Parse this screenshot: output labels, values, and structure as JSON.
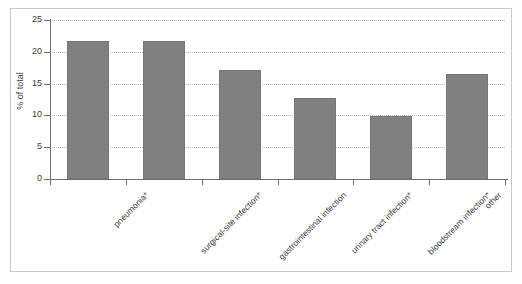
{
  "chart_data": {
    "type": "bar",
    "title": "",
    "xlabel": "",
    "ylabel": "% of total",
    "ylim": [
      0,
      25
    ],
    "yticks": [
      0,
      5,
      10,
      15,
      20,
      25
    ],
    "ytick_labels": [
      "0",
      "5",
      "10",
      "15",
      "20",
      "25"
    ],
    "grid": true,
    "grid_axis": "y",
    "legend": false,
    "categories": [
      "pneumonia*",
      "surgical-site infection*",
      "gastrointestinal infection",
      "urinary tract infection*",
      "bloodstream infection*",
      "other"
    ],
    "values": [
      21.7,
      21.7,
      17.1,
      12.8,
      9.9,
      16.5
    ],
    "bar_color": "#808080",
    "bar_edge_color": "#757575",
    "axis_color": "#6f6f6f",
    "grid_color": "#bdbdbd",
    "frame_color": "#c9c9c9",
    "background": "#ffffff"
  },
  "axes": {
    "y_title": "% of total"
  }
}
